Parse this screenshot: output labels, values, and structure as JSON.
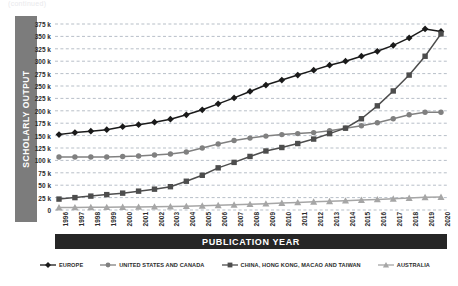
{
  "top_caption": "(continued)",
  "axes": {
    "y_title": "SCHOLARLY OUTPUT",
    "x_title": "PUBLICATION YEAR"
  },
  "legend": {
    "items": [
      {
        "label": "EUROPE",
        "marker": "diamond-marker-icon",
        "color": "#1a1a1a"
      },
      {
        "label": "UNITED STATES AND CANADA",
        "marker": "circle-marker-icon",
        "color": "#808080"
      },
      {
        "label": "CHINA, HONG KONG, MACAO AND TAIWAN",
        "marker": "square-marker-icon",
        "color": "#4d4d4d"
      },
      {
        "label": "AUSTRALIA",
        "marker": "triangle-marker-icon",
        "color": "#a6a6a6"
      }
    ]
  },
  "chart_data": {
    "type": "line",
    "title": "",
    "xlabel": "PUBLICATION YEAR",
    "ylabel": "SCHOLARLY OUTPUT",
    "grid": true,
    "grid_style": "dashed-horizontal",
    "legend_position": "bottom",
    "xlim": [
      1996,
      2020
    ],
    "ylim": [
      0,
      375000
    ],
    "ytick_step": 25000,
    "ytick_labels": [
      "375 k",
      "350 k",
      "325 k",
      "300 k",
      "275 k",
      "250 k",
      "225 k",
      "200 k",
      "175 k",
      "150 k",
      "125 k",
      "100 k",
      "75 k",
      "50 k",
      "25 k",
      "0"
    ],
    "ytick_values": [
      375000,
      350000,
      325000,
      300000,
      275000,
      250000,
      225000,
      200000,
      175000,
      150000,
      125000,
      100000,
      75000,
      50000,
      25000,
      0
    ],
    "categories": [
      1996,
      1997,
      1998,
      1999,
      2000,
      2001,
      2002,
      2003,
      2004,
      2005,
      2006,
      2007,
      2008,
      2009,
      2010,
      2011,
      2012,
      2013,
      2014,
      2015,
      2016,
      2017,
      2018,
      2019,
      2020
    ],
    "xtick_labels": [
      "1996",
      "1997",
      "1998",
      "1999",
      "2000",
      "2001",
      "2002",
      "2003",
      "2004",
      "2005",
      "2006",
      "2007",
      "2008",
      "2009",
      "2010",
      "2011",
      "2012",
      "2013",
      "2014",
      "2015",
      "2016",
      "2017",
      "2018",
      "2019",
      "2020"
    ],
    "series": [
      {
        "name": "EUROPE",
        "color": "#1a1a1a",
        "marker": "diamond",
        "values": [
          152000,
          156000,
          159000,
          162000,
          168000,
          172000,
          177000,
          183000,
          192000,
          202000,
          214000,
          226000,
          239000,
          252000,
          262000,
          272000,
          282000,
          292000,
          300000,
          310000,
          320000,
          332000,
          347000,
          365000,
          360000
        ]
      },
      {
        "name": "UNITED STATES AND CANADA",
        "color": "#808080",
        "marker": "circle",
        "values": [
          107000,
          107000,
          107000,
          107000,
          108000,
          109000,
          111000,
          113000,
          117000,
          125000,
          133000,
          140000,
          145000,
          149000,
          152000,
          154000,
          156000,
          160000,
          165000,
          170000,
          176000,
          184000,
          192000,
          197000,
          197000
        ]
      },
      {
        "name": "CHINA, HONG KONG, MACAO AND TAIWAN",
        "color": "#4d4d4d",
        "marker": "square",
        "values": [
          22000,
          25000,
          28000,
          31000,
          34000,
          38000,
          42000,
          47000,
          58000,
          70000,
          85000,
          96000,
          108000,
          119000,
          126000,
          134000,
          143000,
          154000,
          165000,
          184000,
          210000,
          240000,
          272000,
          310000,
          355000
        ]
      },
      {
        "name": "AUSTRALIA",
        "color": "#a6a6a6",
        "marker": "triangle",
        "values": [
          5000,
          5200,
          5400,
          5600,
          5800,
          6200,
          6600,
          7000,
          7600,
          8400,
          9400,
          10500,
          11600,
          12800,
          14000,
          15200,
          16400,
          17600,
          18800,
          20000,
          21200,
          22500,
          24000,
          25500,
          26000
        ]
      }
    ]
  }
}
